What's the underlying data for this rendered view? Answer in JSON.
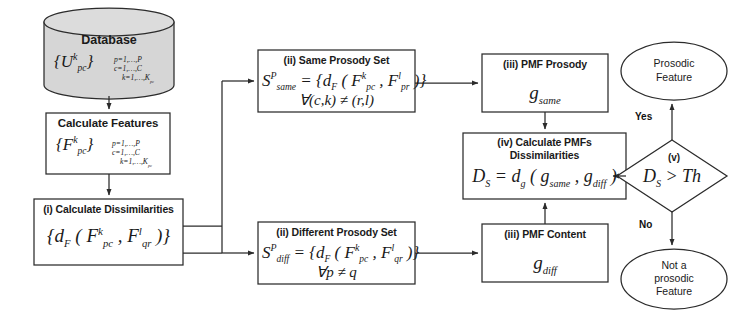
{
  "figure": {
    "type": "flowchart",
    "stroke_color": "#2b2b2b",
    "fill_color": "#ffffff",
    "database_fill": "#d4d4d4",
    "background": "#ffffff"
  },
  "nodes": {
    "database": {
      "shape": "cylinder",
      "label": "Database",
      "symbol_main": "U",
      "symbol_sup": "k",
      "symbol_sub": "pc",
      "index_lines": [
        "p=1,…,P",
        "c=1,…,C",
        "k=1,…,K",
        "pc"
      ],
      "index_line_1": "p=1,…,P",
      "index_line_2": "c=1,…,C",
      "index_line_3": "k=1,…,K",
      "index_line_3_sub": "pc"
    },
    "calculate_features": {
      "shape": "rect",
      "label": "Calculate Features",
      "symbol_main": "F",
      "symbol_sup": "k",
      "symbol_sub": "pc",
      "index_line_1": "p=1,…,P",
      "index_line_2": "c=1,…,C",
      "index_line_3": "k=1,…,K",
      "index_line_3_sub": "pc"
    },
    "calculate_dissimilarities": {
      "shape": "rect",
      "step": "(i)",
      "label": "(i) Calculate Dissimilarities",
      "formula": "{ d_F ( F^k_pc , F^l_qr ) }"
    },
    "same_prosody_set": {
      "shape": "rect",
      "step": "(ii)",
      "label": "(ii) Same Prosody Set",
      "formula": "S^P_same = { d_F ( F^k_pc , F^l_pr ) }",
      "condition": "∀(c,k) ≠ (r,l)"
    },
    "different_prosody_set": {
      "shape": "rect",
      "step": "(ii)",
      "label": "(ii) Different Prosody Set",
      "formula": "S^P_diff = { d_F ( F^k_pc , F^l_qr ) }",
      "condition": "∀p ≠ q"
    },
    "pmf_prosody": {
      "shape": "rect",
      "step": "(iii)",
      "label": "(iii) PMF Prosody",
      "symbol_main": "g",
      "symbol_sub": "same"
    },
    "pmf_content": {
      "shape": "rect",
      "step": "(iii)",
      "label": "(iii) PMF Content",
      "symbol_main": "g",
      "symbol_sub": "diff"
    },
    "calculate_pmfs": {
      "shape": "rect",
      "step": "(iv)",
      "label_line_1": "(iv) Calculate PMFs",
      "label_line_2": "Dissimilarities",
      "formula": "D_S = d_g ( g_same , g_diff )"
    },
    "decision": {
      "shape": "diamond",
      "step": "(v)",
      "step_label": "(v)",
      "condition": "D_S > Th",
      "condition_lhs": "D",
      "condition_lhs_sub": "S",
      "condition_op": " > ",
      "condition_rhs": "Th"
    },
    "prosodic_feature": {
      "shape": "ellipse",
      "line_1": "Prosodic",
      "line_2": "Feature"
    },
    "not_prosodic_feature": {
      "shape": "ellipse",
      "line_1": "Not a",
      "line_2": "prosodic",
      "line_3": "Feature"
    }
  },
  "edge_labels": {
    "yes": "Yes",
    "no": "No"
  }
}
